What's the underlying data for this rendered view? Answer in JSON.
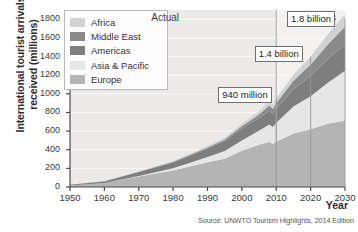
{
  "figure": {
    "y_axis_title": "International tourist arrivals received (millions)",
    "x_axis_title": "Year",
    "source": "Source: UNWTO Tourism Highlights, 2014 Edition"
  },
  "legend": {
    "items": [
      {
        "label": "Africa",
        "color": "#d2d2d2"
      },
      {
        "label": "Middle East",
        "color": "#8a8a8a"
      },
      {
        "label": "Americas",
        "color": "#7e7e7e"
      },
      {
        "label": "Asia & Pacific",
        "color": "#e6e6e6"
      },
      {
        "label": "Europe",
        "color": "#b4b4b4"
      }
    ]
  },
  "periods": [
    {
      "label": "Actual",
      "x": 1978
    },
    {
      "label": "Forecasts",
      "x": 2021
    }
  ],
  "callouts": [
    {
      "label": "940 million",
      "year": 2010,
      "value": 940
    },
    {
      "label": "1.4 billion",
      "year": 2020,
      "value": 1400
    },
    {
      "label": "1.8 billion",
      "year": 2030,
      "value": 1800
    }
  ],
  "chart_data": {
    "type": "area",
    "title": "",
    "subtitle": "",
    "xlabel": "Year",
    "ylabel": "International tourist arrivals received (millions)",
    "xlim": [
      1950,
      2030
    ],
    "ylim": [
      0,
      1900
    ],
    "xticks": [
      1950,
      1960,
      1970,
      1980,
      1990,
      2000,
      2010,
      2020,
      2030
    ],
    "yticks": [
      0,
      200,
      400,
      600,
      800,
      1000,
      1200,
      1400,
      1600,
      1800
    ],
    "grid": true,
    "grid_axis": "y",
    "legend_position": "upper-left",
    "stacked": true,
    "stack_order_bottom_to_top": [
      "Europe",
      "Asia & Pacific",
      "Americas",
      "Middle East",
      "Africa"
    ],
    "annotations": [
      {
        "text": "Actual",
        "x": 1978
      },
      {
        "text": "Forecasts",
        "x": 2021
      },
      {
        "text": "940 million",
        "x": 2010,
        "y": 940
      },
      {
        "text": "1.4 billion",
        "x": 2020,
        "y": 1400
      },
      {
        "text": "1.8 billion",
        "x": 2030,
        "y": 1800
      }
    ],
    "x": [
      1950,
      1960,
      1970,
      1980,
      1990,
      1995,
      2000,
      2005,
      2008,
      2009,
      2010,
      2015,
      2020,
      2025,
      2030
    ],
    "series": [
      {
        "name": "Europe",
        "color": "#b4b4b4",
        "values": [
          17,
          43,
          113,
          178,
          265,
          304,
          388,
          453,
          487,
          462,
          487,
          575,
          620,
          680,
          713
        ]
      },
      {
        "name": "Asia & Pacific",
        "color": "#e6e6e6",
        "values": [
          0.2,
          0.9,
          6,
          23,
          56,
          82,
          110,
          154,
          184,
          181,
          204,
          290,
          355,
          440,
          535
        ]
      },
      {
        "name": "Americas",
        "color": "#7e7e7e",
        "values": [
          7,
          16,
          43,
          62,
          93,
          109,
          128,
          133,
          148,
          141,
          150,
          185,
          220,
          250,
          280
        ]
      },
      {
        "name": "Middle East",
        "color": "#8a8a8a",
        "values": [
          0.2,
          0.6,
          2,
          7,
          10,
          14,
          25,
          37,
          56,
          53,
          61,
          90,
          120,
          160,
          195
        ]
      },
      {
        "name": "Africa",
        "color": "#d2d2d2",
        "values": [
          0.5,
          0.8,
          3,
          7,
          15,
          20,
          27,
          37,
          45,
          46,
          50,
          65,
          85,
          110,
          134
        ]
      }
    ],
    "totals": [
      25,
      61,
      167,
      277,
      439,
      529,
      678,
      814,
      920,
      883,
      952,
      1205,
      1400,
      1640,
      1857
    ]
  }
}
